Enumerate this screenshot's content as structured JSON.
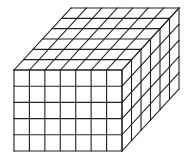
{
  "figure": {
    "description": "Rectangular prism built from unit cubes",
    "dimensions": {
      "width": 7,
      "height": 5,
      "depth": 6
    },
    "line_color": "#222222",
    "background": "#ffffff",
    "front_face": {
      "x0": 14,
      "y0": 70,
      "x1": 122,
      "y1": 151
    },
    "depth_offset": {
      "dx": 57,
      "dy": -62
    }
  }
}
